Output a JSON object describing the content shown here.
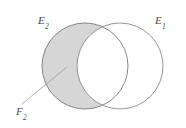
{
  "figure": {
    "kind": "venn-diagram",
    "width": 186,
    "height": 128,
    "background_color": "#ffffff"
  },
  "labels": {
    "left_set": {
      "base": "E",
      "subscript": "2",
      "full": "E2"
    },
    "right_set": {
      "base": "E",
      "subscript": "1",
      "full": "E1"
    },
    "shaded_region": {
      "base": "F",
      "subscript": "2",
      "full": "F2"
    }
  },
  "shapes": {
    "left_circle": {
      "name": "E2",
      "cx": 85,
      "cy": 66,
      "r": 43,
      "stroke_color": "#7a7a7a",
      "stroke_width": 0.9,
      "fill": "none"
    },
    "right_circle": {
      "name": "E1",
      "cx": 120,
      "cy": 66,
      "r": 43,
      "stroke_color": "#8a8a8a",
      "stroke_width": 0.9,
      "fill": "none"
    },
    "shaded_region": {
      "name": "F2",
      "description": "left circle minus intersection with right circle",
      "fill_color": "#d6d6d6",
      "stroke_color": "#6f6f6f"
    },
    "leader_line": {
      "name": "F2-leader",
      "x1": 67,
      "y1": 67,
      "x2": 22,
      "y2": 104,
      "stroke_color": "#9a9a9a",
      "stroke_width": 0.8
    }
  },
  "chart_data": {
    "type": "diagram",
    "title": "",
    "sets": [
      {
        "label": "E2",
        "position": "left",
        "shaded": true
      },
      {
        "label": "E1",
        "position": "right",
        "shaded": false
      }
    ],
    "annotations": [
      {
        "label": "F2",
        "points_to": "E2 minus (E1 intersect E2)",
        "placement": "bottom-left"
      }
    ]
  }
}
